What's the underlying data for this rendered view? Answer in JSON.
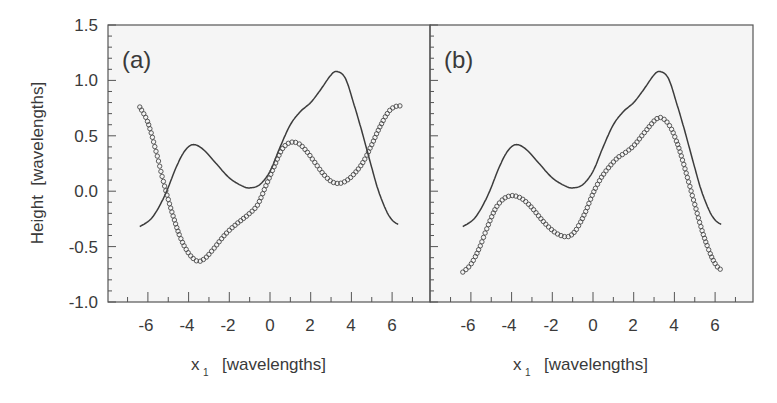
{
  "chart_data": [
    {
      "type": "line",
      "panel_label": "(a)",
      "xlabel": "x₁ [wavelengths]",
      "ylabel": "Height  [wavelengths]",
      "xlim": [
        -7.9,
        7.9
      ],
      "ylim": [
        -1.0,
        1.5
      ],
      "xticks": [
        -6,
        -4,
        -2,
        0,
        2,
        4,
        6
      ],
      "yticks": [
        -1.0,
        -0.5,
        0.0,
        0.5,
        1.0,
        1.5
      ],
      "grid": false,
      "series": [
        {
          "name": "solid-line",
          "style": "line",
          "x": [
            -6.4,
            -5.8,
            -5.2,
            -4.6,
            -4.2,
            -3.8,
            -3.3,
            -2.6,
            -2.0,
            -1.4,
            -1.0,
            -0.5,
            0.0,
            0.5,
            1.0,
            1.5,
            2.0,
            2.5,
            3.0,
            3.3,
            3.7,
            4.1,
            4.5,
            4.9,
            5.3,
            5.7,
            6.0,
            6.3
          ],
          "y": [
            -0.32,
            -0.24,
            -0.05,
            0.22,
            0.36,
            0.42,
            0.38,
            0.24,
            0.12,
            0.05,
            0.03,
            0.06,
            0.18,
            0.4,
            0.6,
            0.72,
            0.8,
            0.92,
            1.05,
            1.08,
            1.02,
            0.8,
            0.55,
            0.28,
            0.02,
            -0.17,
            -0.26,
            -0.3
          ]
        },
        {
          "name": "circles",
          "style": "markers",
          "x": [
            -6.4,
            -6.0,
            -5.6,
            -5.2,
            -4.8,
            -4.4,
            -4.0,
            -3.6,
            -3.3,
            -3.0,
            -2.6,
            -2.2,
            -1.8,
            -1.4,
            -1.0,
            -0.6,
            -0.2,
            0.2,
            0.6,
            1.0,
            1.4,
            1.8,
            2.2,
            2.6,
            3.0,
            3.4,
            3.8,
            4.2,
            4.6,
            5.0,
            5.4,
            5.8,
            6.1,
            6.4
          ],
          "y": [
            0.76,
            0.62,
            0.36,
            0.06,
            -0.2,
            -0.42,
            -0.56,
            -0.63,
            -0.62,
            -0.57,
            -0.48,
            -0.39,
            -0.32,
            -0.26,
            -0.2,
            -0.12,
            0.05,
            0.22,
            0.38,
            0.44,
            0.43,
            0.36,
            0.26,
            0.16,
            0.09,
            0.07,
            0.1,
            0.17,
            0.27,
            0.42,
            0.58,
            0.71,
            0.76,
            0.77
          ]
        }
      ]
    },
    {
      "type": "line",
      "panel_label": "(b)",
      "xlabel": "x₁ [wavelengths]",
      "ylabel": "",
      "xlim": [
        -7.9,
        7.9
      ],
      "ylim": [
        -1.0,
        1.5
      ],
      "xticks": [
        -6,
        -4,
        -2,
        0,
        2,
        4,
        6
      ],
      "yticks": [
        -1.0,
        -0.5,
        0.0,
        0.5,
        1.0,
        1.5
      ],
      "grid": false,
      "series": [
        {
          "name": "solid-line",
          "style": "line",
          "x": [
            -6.4,
            -5.8,
            -5.2,
            -4.6,
            -4.2,
            -3.8,
            -3.3,
            -2.6,
            -2.0,
            -1.4,
            -1.0,
            -0.5,
            0.0,
            0.5,
            1.0,
            1.5,
            2.0,
            2.5,
            3.0,
            3.3,
            3.7,
            4.1,
            4.5,
            4.9,
            5.3,
            5.7,
            6.0,
            6.3
          ],
          "y": [
            -0.32,
            -0.24,
            -0.05,
            0.22,
            0.36,
            0.42,
            0.38,
            0.24,
            0.12,
            0.05,
            0.03,
            0.06,
            0.18,
            0.4,
            0.6,
            0.72,
            0.8,
            0.92,
            1.05,
            1.08,
            1.02,
            0.8,
            0.55,
            0.28,
            0.02,
            -0.17,
            -0.26,
            -0.3
          ]
        },
        {
          "name": "circles",
          "style": "markers",
          "x": [
            -6.4,
            -6.0,
            -5.6,
            -5.2,
            -4.8,
            -4.4,
            -4.0,
            -3.7,
            -3.4,
            -3.0,
            -2.6,
            -2.2,
            -1.8,
            -1.4,
            -1.1,
            -0.8,
            -0.4,
            0.0,
            0.4,
            0.8,
            1.2,
            1.6,
            2.0,
            2.4,
            2.8,
            3.1,
            3.4,
            3.8,
            4.2,
            4.6,
            5.0,
            5.4,
            5.8,
            6.1,
            6.4
          ],
          "y": [
            -0.73,
            -0.66,
            -0.52,
            -0.33,
            -0.16,
            -0.07,
            -0.04,
            -0.05,
            -0.08,
            -0.15,
            -0.24,
            -0.32,
            -0.38,
            -0.41,
            -0.4,
            -0.34,
            -0.2,
            -0.02,
            0.12,
            0.22,
            0.3,
            0.35,
            0.41,
            0.5,
            0.59,
            0.65,
            0.66,
            0.58,
            0.4,
            0.15,
            -0.12,
            -0.38,
            -0.58,
            -0.68,
            -0.72
          ]
        }
      ]
    }
  ],
  "labels": {
    "panel_a": "(a)",
    "panel_b": "(b)",
    "ylabel": "Height  [wavelengths]",
    "xlabel_x": "x",
    "xlabel_sub": "1",
    "xlabel_unit": "[wavelengths]",
    "yticks": [
      "1.5",
      "1.0",
      "0.5",
      "0.0",
      "-0.5",
      "-1.0"
    ],
    "xticks": [
      "-6",
      "-4",
      "-2",
      "0",
      "2",
      "4",
      "6"
    ]
  },
  "colors": {
    "line": "#3c3c3c",
    "marker": "#4a4a4a",
    "frame": "#555555",
    "plot_bg": "#f5f5f5",
    "text": "#3a3a3a"
  }
}
